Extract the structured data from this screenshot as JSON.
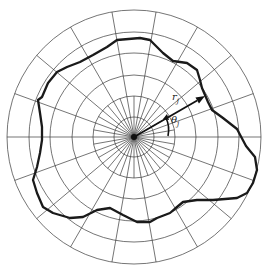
{
  "diagram": {
    "type": "polar-grid-with-closed-contour",
    "center": [
      134,
      137
    ],
    "rings": [
      20,
      41,
      62,
      84,
      105,
      127
    ],
    "inner_ray_step_deg": 10,
    "inner_ray_radius": 41,
    "outer_ray_step_deg": 20,
    "colors": {
      "grid": "#3a3a3a",
      "contour": "#1a1a1a",
      "background": "#ffffff"
    },
    "contour_points": [
      [
        140,
        38
      ],
      [
        150,
        40
      ],
      [
        163,
        53
      ],
      [
        173,
        61
      ],
      [
        187,
        63
      ],
      [
        197,
        70
      ],
      [
        200,
        80
      ],
      [
        202,
        88
      ],
      [
        205,
        95
      ],
      [
        208,
        102
      ],
      [
        212,
        110
      ],
      [
        223,
        118
      ],
      [
        237,
        129
      ],
      [
        246,
        146
      ],
      [
        255,
        157
      ],
      [
        257,
        170
      ],
      [
        253,
        183
      ],
      [
        247,
        193
      ],
      [
        237,
        198
      ],
      [
        213,
        200
      ],
      [
        197,
        200
      ],
      [
        183,
        202
      ],
      [
        177,
        207
      ],
      [
        170,
        213
      ],
      [
        157,
        218
      ],
      [
        150,
        222
      ],
      [
        137,
        222
      ],
      [
        123,
        215
      ],
      [
        110,
        208
      ],
      [
        97,
        210
      ],
      [
        83,
        217
      ],
      [
        70,
        218
      ],
      [
        53,
        213
      ],
      [
        43,
        207
      ],
      [
        37,
        193
      ],
      [
        33,
        180
      ],
      [
        37,
        167
      ],
      [
        40,
        153
      ],
      [
        42,
        140
      ],
      [
        42,
        127
      ],
      [
        40,
        113
      ],
      [
        38,
        100
      ],
      [
        42,
        97
      ],
      [
        48,
        83
      ],
      [
        57,
        72
      ],
      [
        67,
        67
      ],
      [
        80,
        62
      ],
      [
        93,
        55
      ],
      [
        107,
        47
      ],
      [
        117,
        40
      ]
    ],
    "vector": {
      "from": [
        134,
        137
      ],
      "to": [
        205,
        96
      ]
    },
    "labels": {
      "radius": {
        "main": "r",
        "sub": "j"
      },
      "angle": {
        "main": "θ",
        "sub": "j"
      }
    }
  }
}
